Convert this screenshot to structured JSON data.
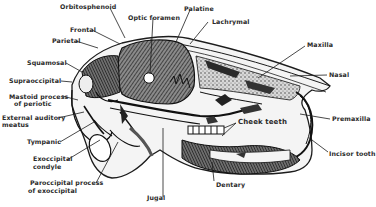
{
  "figure": {
    "colors": {
      "ink": "#1c1c1c",
      "bone_shade": "#555555",
      "background": "#ffffff"
    }
  },
  "labels": {
    "orbitosphenoid": "Orbitosphenoid",
    "optic_foramen": "Optic foramen",
    "palatine": "Palatine",
    "lachrymal": "Lachrymal",
    "frontal": "Frontal",
    "parietal": "Parietal",
    "squamosal": "Squamosal",
    "supraoccipital": "Supraoccipital",
    "mastoid_1": "Mastoid process",
    "mastoid_2": "of periotic",
    "ext_aud_1": "External auditory",
    "ext_aud_2": "meatus",
    "tympanic": "Tympanic",
    "exocc_1": "Exoccipital",
    "exocc_2": "condyle",
    "parocc_1": "Paroccipital process",
    "parocc_2": "of exoccipital",
    "jugal": "Jugal",
    "dentary": "Dentary",
    "cheek_teeth": "Cheek teeth",
    "maxilla": "Maxilla",
    "nasal": "Nasal",
    "premaxilla": "Premaxilla",
    "incisor_tooth": "Incisor tooth"
  }
}
